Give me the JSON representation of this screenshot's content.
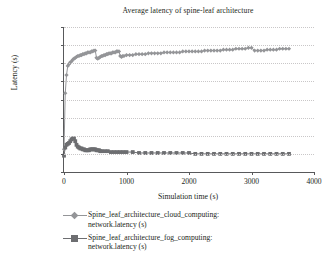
{
  "chart_data": {
    "type": "line",
    "title": "Average latency of spine-leaf architecture",
    "xlabel": "Simulation time (s)",
    "ylabel": "Latency (s)",
    "xlim": [
      0,
      4000
    ],
    "ylim": [
      0,
      0.0016
    ],
    "xticks": [
      "0",
      "1000",
      "2000",
      "3000",
      "4000"
    ],
    "xtick_values": [
      0,
      1000,
      2000,
      3000,
      4000
    ],
    "yticks": [
      "0",
      "0.0002",
      "0.0004",
      "0.0006",
      "0.0008",
      "0.001",
      "0.0012",
      "0.0014",
      "0.0016"
    ],
    "ytick_values": [
      0,
      0.0002,
      0.0004,
      0.0006,
      0.0008,
      0.001,
      0.0012,
      0.0014,
      0.0016
    ],
    "grid": "horizontal-dotted",
    "legend_position": "bottom-left",
    "series": [
      {
        "name": "Spine_leaf_architecture_cloud_computing: network.latency (s)",
        "name_line1": "Spine_leaf_architecture_cloud_computing:",
        "name_line2": "network.latency (s)",
        "color": "#949598",
        "marker": "diamond",
        "x": [
          0,
          20,
          40,
          60,
          80,
          100,
          120,
          140,
          160,
          180,
          200,
          220,
          240,
          260,
          280,
          300,
          320,
          340,
          360,
          380,
          400,
          420,
          440,
          460,
          480,
          500,
          520,
          540,
          560,
          580,
          600,
          620,
          640,
          660,
          680,
          700,
          720,
          740,
          760,
          780,
          800,
          820,
          840,
          860,
          880,
          900,
          920,
          940,
          960,
          1000,
          1050,
          1100,
          1150,
          1200,
          1250,
          1300,
          1350,
          1400,
          1450,
          1500,
          1550,
          1600,
          1650,
          1700,
          1750,
          1800,
          1850,
          1900,
          1950,
          2000,
          2050,
          2100,
          2150,
          2200,
          2250,
          2300,
          2350,
          2400,
          2450,
          2500,
          2550,
          2600,
          2650,
          2700,
          2750,
          2800,
          2850,
          2900,
          2950,
          3000,
          3050,
          3100,
          3150,
          3200,
          3250,
          3300,
          3350,
          3400,
          3450,
          3500,
          3550,
          3600
        ],
        "y": [
          0.00025,
          0.00087,
          0.00107,
          0.00117,
          0.00119,
          0.00121,
          0.00122,
          0.00124,
          0.00125,
          0.00126,
          0.00127,
          0.00128,
          0.00128,
          0.00129,
          0.00129,
          0.0013,
          0.0013,
          0.00131,
          0.00131,
          0.00132,
          0.00132,
          0.00132,
          0.00133,
          0.00133,
          0.00134,
          0.00134,
          0.00126,
          0.00125,
          0.00126,
          0.00127,
          0.00128,
          0.00128,
          0.00129,
          0.00129,
          0.0013,
          0.0013,
          0.00131,
          0.00131,
          0.00131,
          0.00132,
          0.00132,
          0.00132,
          0.00133,
          0.00133,
          0.00133,
          0.00128,
          0.00127,
          0.00128,
          0.00128,
          0.00129,
          0.00129,
          0.00129,
          0.0013,
          0.0013,
          0.0013,
          0.0013,
          0.00131,
          0.00131,
          0.00131,
          0.00131,
          0.00131,
          0.00132,
          0.00132,
          0.00132,
          0.00132,
          0.00132,
          0.00132,
          0.00133,
          0.00133,
          0.00133,
          0.00133,
          0.00133,
          0.00133,
          0.00133,
          0.00134,
          0.00134,
          0.00134,
          0.00134,
          0.00134,
          0.00134,
          0.00135,
          0.00135,
          0.00135,
          0.00135,
          0.00136,
          0.00136,
          0.00136,
          0.00136,
          0.00137,
          0.00137,
          0.00134,
          0.00134,
          0.00134,
          0.00134,
          0.00135,
          0.00135,
          0.00135,
          0.00135,
          0.00136,
          0.00136,
          0.00136,
          0.00136
        ]
      },
      {
        "name": "Spine_leaf_architecture_fog_computing: network.latency (s)",
        "name_line1": "Spine_leaf_architecture_fog_computing:",
        "name_line2": "network.latency (s)",
        "color": "#6d6e71",
        "marker": "square",
        "x": [
          0,
          20,
          40,
          60,
          80,
          100,
          120,
          140,
          160,
          180,
          200,
          220,
          240,
          260,
          280,
          300,
          320,
          340,
          360,
          380,
          400,
          420,
          440,
          460,
          480,
          500,
          520,
          540,
          560,
          580,
          600,
          650,
          700,
          750,
          800,
          850,
          900,
          950,
          1000,
          1100,
          1200,
          1300,
          1400,
          1500,
          1600,
          1700,
          1800,
          1900,
          2000,
          2100,
          2200,
          2300,
          2400,
          2500,
          2600,
          2700,
          2800,
          2900,
          3000,
          3100,
          3200,
          3300,
          3400,
          3500,
          3600
        ],
        "y": [
          0.00018,
          0.00027,
          0.0003,
          0.00031,
          0.00032,
          0.00034,
          0.00036,
          0.00037,
          0.00037,
          0.00034,
          0.0003,
          0.00028,
          0.00027,
          0.00026,
          0.00026,
          0.00025,
          0.00025,
          0.00024,
          0.00024,
          0.00024,
          0.00024,
          0.00025,
          0.00025,
          0.00025,
          0.00025,
          0.00025,
          0.00024,
          0.00024,
          0.00024,
          0.00023,
          0.00023,
          0.00023,
          0.00023,
          0.00022,
          0.00022,
          0.00022,
          0.00022,
          0.00022,
          0.00022,
          0.00022,
          0.00021,
          0.00021,
          0.00021,
          0.00021,
          0.00021,
          0.00021,
          0.00021,
          0.00021,
          0.00021,
          0.0002,
          0.0002,
          0.0002,
          0.0002,
          0.0002,
          0.0002,
          0.0002,
          0.0002,
          0.0002,
          0.0002,
          0.0002,
          0.0002,
          0.0002,
          0.0002,
          0.0002,
          0.0002
        ]
      }
    ]
  }
}
